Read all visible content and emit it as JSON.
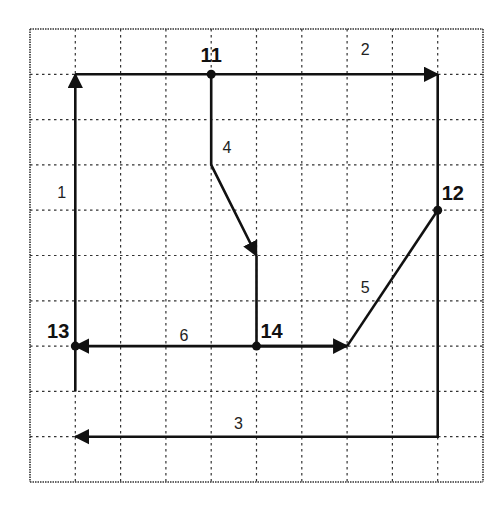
{
  "diagram": {
    "type": "directed-path-grid",
    "grid": {
      "columns": 10,
      "rows": 10,
      "origin_px": [
        30,
        29
      ],
      "cell_px": 45.3,
      "line_color": "#333333",
      "line_style": "dotted"
    },
    "nodes": [
      {
        "id": "11",
        "label": "11",
        "grid": [
          4,
          1
        ]
      },
      {
        "id": "12",
        "label": "12",
        "grid": [
          9,
          4
        ]
      },
      {
        "id": "13",
        "label": "13",
        "grid": [
          1,
          7
        ]
      },
      {
        "id": "14",
        "label": "14",
        "grid": [
          5,
          7
        ]
      }
    ],
    "segments": [
      {
        "label": "1",
        "points": [
          [
            1,
            8
          ],
          [
            1,
            1
          ]
        ],
        "arrow_at_end": true
      },
      {
        "label": "2",
        "points": [
          [
            1,
            1
          ],
          [
            9,
            1
          ]
        ],
        "arrow_at_end": true
      },
      {
        "label": "3",
        "points": [
          [
            9,
            1
          ],
          [
            9,
            9
          ],
          [
            1,
            9
          ]
        ],
        "arrow_at_end": true
      },
      {
        "label": "4",
        "points": [
          [
            4,
            1
          ],
          [
            4,
            3
          ],
          [
            5,
            5
          ]
        ],
        "arrow_at_end": true
      },
      {
        "label": "5",
        "points": [
          [
            9,
            4
          ],
          [
            7,
            7
          ]
        ],
        "arrow_at_end": false
      },
      {
        "label": "6",
        "points": [
          [
            7,
            7
          ],
          [
            1,
            7
          ]
        ],
        "arrow_at_end": true
      },
      {
        "label": "",
        "points": [
          [
            5,
            5
          ],
          [
            5,
            7
          ],
          [
            7,
            7
          ]
        ],
        "arrow_at_end": true
      }
    ],
    "segment_labels": [
      {
        "text": "1",
        "grid": [
          0.7,
          3.6
        ]
      },
      {
        "text": "2",
        "grid": [
          7.4,
          0.45
        ]
      },
      {
        "text": "3",
        "grid": [
          4.6,
          8.7
        ]
      },
      {
        "text": "4",
        "grid": [
          4.35,
          2.6
        ]
      },
      {
        "text": "5",
        "grid": [
          7.4,
          5.7
        ]
      },
      {
        "text": "6",
        "grid": [
          3.4,
          6.75
        ]
      }
    ]
  }
}
